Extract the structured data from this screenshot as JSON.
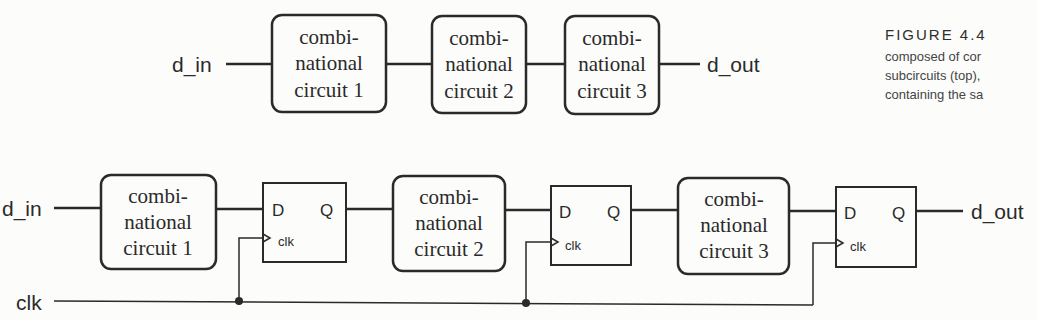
{
  "figure": {
    "label": "FIGURE 4.4",
    "caption_lines": [
      "composed of cor",
      "subcircuits (top),",
      "containing the sa"
    ]
  },
  "top_diagram": {
    "input": "d_in",
    "output": "d_out",
    "blocks": [
      {
        "l1": "combi-",
        "l2": "national",
        "l3": "circuit 1"
      },
      {
        "l1": "combi-",
        "l2": "national",
        "l3": "circuit 2"
      },
      {
        "l1": "combi-",
        "l2": "national",
        "l3": "circuit 3"
      }
    ]
  },
  "bottom_diagram": {
    "input": "d_in",
    "output": "d_out",
    "clock": "clk",
    "blocks": [
      {
        "l1": "combi-",
        "l2": "national",
        "l3": "circuit 1"
      },
      {
        "l1": "combi-",
        "l2": "national",
        "l3": "circuit 2"
      },
      {
        "l1": "combi-",
        "l2": "national",
        "l3": "circuit 3"
      }
    ],
    "flipflops": [
      {
        "d": "D",
        "q": "Q",
        "clk": "clk"
      },
      {
        "d": "D",
        "q": "Q",
        "clk": "clk"
      },
      {
        "d": "D",
        "q": "Q",
        "clk": "clk"
      }
    ]
  },
  "colors": {
    "line": "#2a2a2a",
    "background": "#fcfcfb"
  }
}
